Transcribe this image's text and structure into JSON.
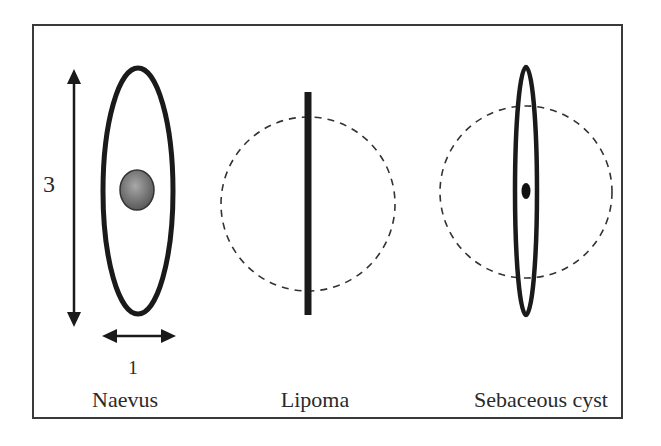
{
  "diagram": {
    "panels": [
      {
        "id": "naevus",
        "caption": "Naevus",
        "shape": "elliptical excision 3:1 with central lesion",
        "dimension_labels": {
          "length": "3",
          "width": "1"
        }
      },
      {
        "id": "lipoma",
        "caption": "Lipoma",
        "shape": "linear incision across dashed circular lump"
      },
      {
        "id": "sebaceous-cyst",
        "caption": "Sebaceous cyst",
        "shape": "narrow ellipse across dashed circular lump with central punctum"
      }
    ],
    "colors": {
      "stroke": "#1a1a1a",
      "frame": "#3a3a3a",
      "lesion_fill": "#7a7a7a",
      "dashed": "#333333",
      "background": "#ffffff"
    }
  }
}
